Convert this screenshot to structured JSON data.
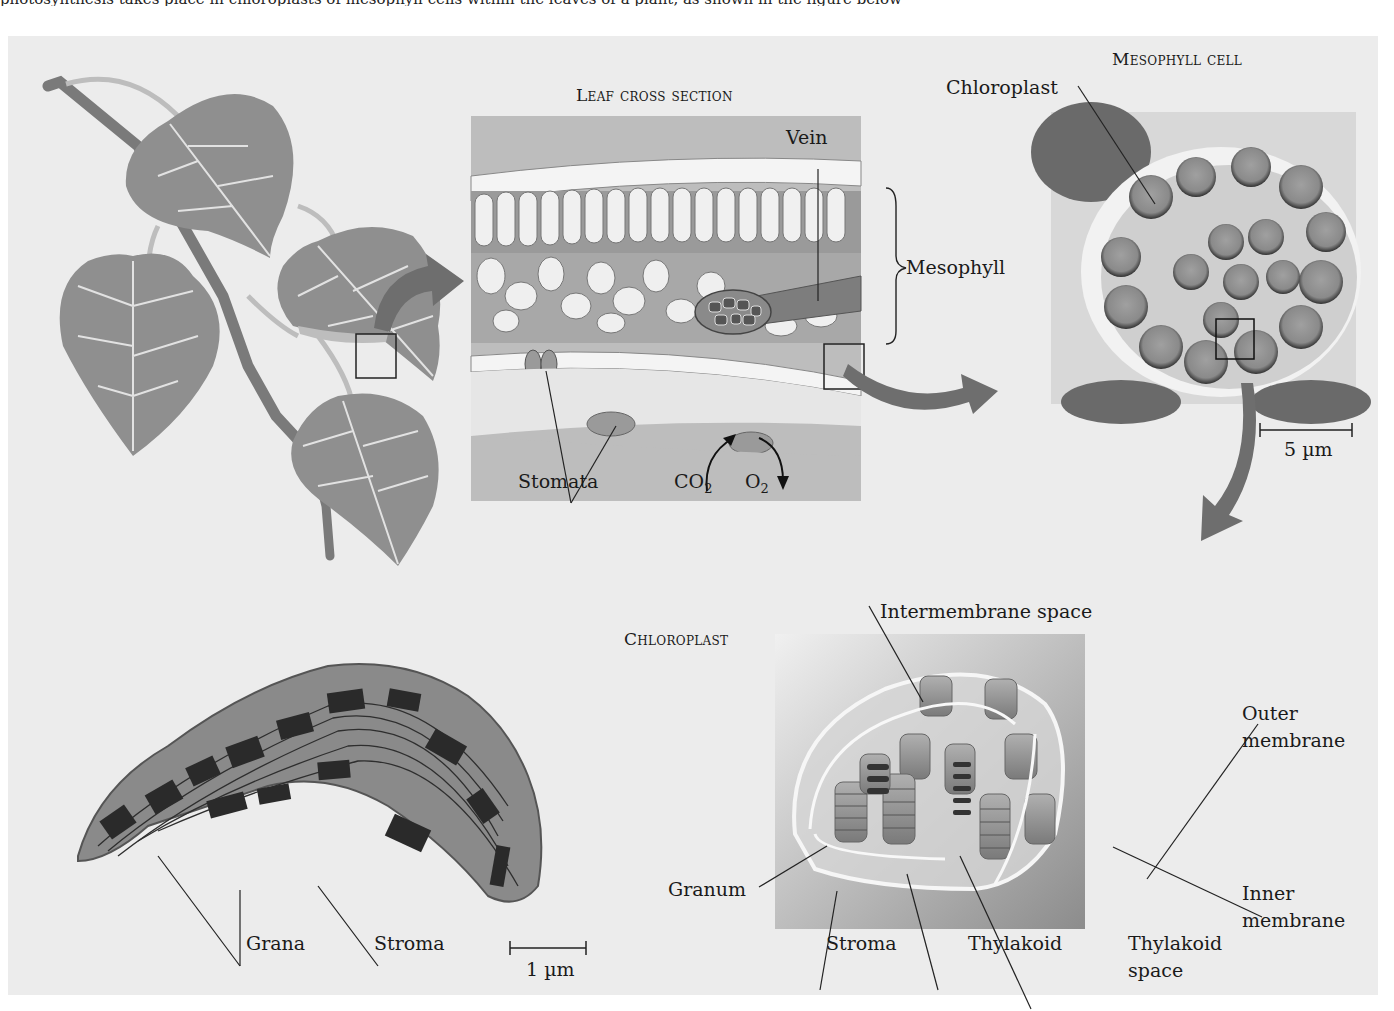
{
  "figure": {
    "top_clipped_text": "photosynthesis takes place in chloroplasts of mesophyll cells within the leaves of a plant, as shown in the figure below"
  },
  "panels": {
    "leaf": {
      "name": "leaf-branch-illustration"
    },
    "leaf_cross_section": {
      "title": "Leaf cross section",
      "labels": {
        "vein": "Vein",
        "mesophyll": "Mesophyll",
        "stomata": "Stomata",
        "co2_main": "CO",
        "co2_sub": "2",
        "o2_main": "O",
        "o2_sub": "2"
      }
    },
    "mesophyll_cell": {
      "title": "Mesophyll cell",
      "labels": {
        "chloroplast": "Chloroplast"
      },
      "scale_bar": "5 µm"
    },
    "chloroplast_micrograph": {
      "labels": {
        "grana": "Grana",
        "stroma": "Stroma"
      },
      "scale_bar": "1 µm"
    },
    "chloroplast_diagram": {
      "title": "Chloroplast",
      "labels": {
        "intermembrane_space": "Intermembrane space",
        "outer_membrane_1": "Outer",
        "outer_membrane_2": "membrane",
        "granum": "Granum",
        "inner_membrane_1": "Inner",
        "inner_membrane_2": "membrane",
        "stroma": "Stroma",
        "thylakoid": "Thylakoid",
        "thylakoid_space_1": "Thylakoid",
        "thylakoid_space_2": "space"
      }
    }
  },
  "colors": {
    "panel_bg": "#ececec",
    "leaf_fill": "#8f8f8f",
    "leaf_vein": "#e6e6e6",
    "arrow": "#6e6e6e",
    "micrograph_dark": "#2e2e2e",
    "micrograph_mid": "#8a8a8a"
  }
}
